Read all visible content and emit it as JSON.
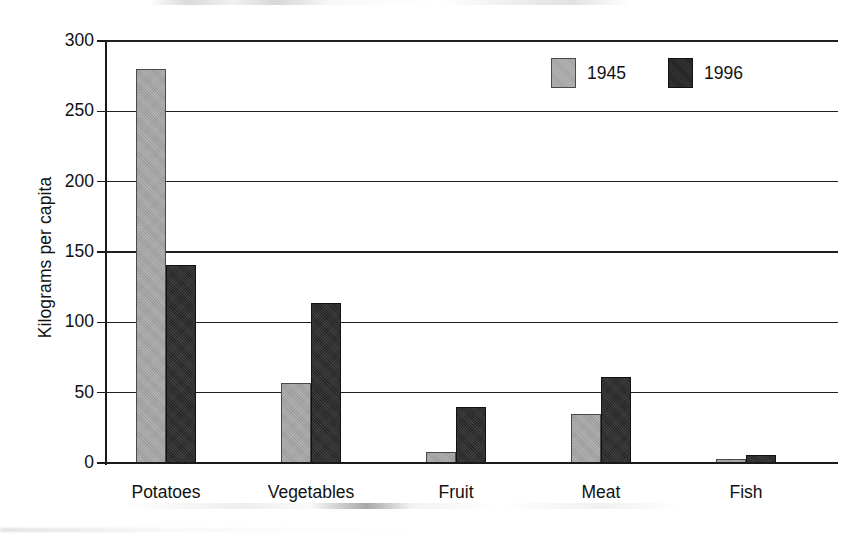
{
  "chart_data": {
    "type": "bar",
    "title": "",
    "subtitle": "",
    "xlabel": "",
    "ylabel": "Kilograms per capita",
    "ylim": [
      0,
      300
    ],
    "yticks": [
      0,
      50,
      100,
      150,
      200,
      250,
      300
    ],
    "ytick_labels": [
      "0",
      "50",
      "100",
      "150",
      "200",
      "250",
      "300"
    ],
    "grid": "horizontal",
    "legend_position": "top-right",
    "categories": [
      "Potatoes",
      "Vegetables",
      "Fruit",
      "Meat",
      "Fish"
    ],
    "series": [
      {
        "name": "1945",
        "color": "#a2a2a2",
        "values": [
          280,
          57,
          8,
          35,
          3
        ]
      },
      {
        "name": "1996",
        "color": "#252525",
        "values": [
          141,
          114,
          40,
          61,
          6
        ]
      }
    ],
    "annotations": []
  },
  "legend": {
    "items": [
      {
        "label": "1945",
        "swatch": "legend-swatch-1945"
      },
      {
        "label": "1996",
        "swatch": "legend-swatch-1996"
      }
    ]
  },
  "axes": {
    "y_title": "Kilograms per capita"
  }
}
